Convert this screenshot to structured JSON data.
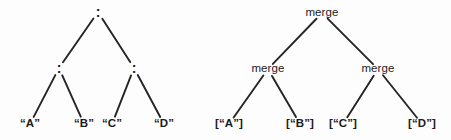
{
  "figure": {
    "background_color": "#fdfdfd",
    "ink_color": "#1b1b1b",
    "edge_color": "#242424",
    "width": 451,
    "height": 140
  },
  "diagram_data": {
    "type": "diagram",
    "subtype": "binary-expression-trees",
    "tree_count": 2,
    "trees": [
      {
        "id": "cons-tree",
        "name": "left-cons-tree",
        "root_operator": ":",
        "nodes": [
          {
            "id": "L0",
            "label": ":",
            "role": "operator",
            "depth": 0,
            "x": 98,
            "y": 12
          },
          {
            "id": "L1",
            "label": ":",
            "role": "operator",
            "depth": 1,
            "x": 59,
            "y": 68
          },
          {
            "id": "L2",
            "label": ":",
            "role": "operator",
            "depth": 1,
            "x": 134,
            "y": 68
          },
          {
            "id": "L3",
            "label": "“A”",
            "role": "leaf",
            "depth": 2,
            "x": 30,
            "y": 124
          },
          {
            "id": "L4",
            "label": "“B”",
            "role": "leaf",
            "depth": 2,
            "x": 84,
            "y": 124
          },
          {
            "id": "L5",
            "label": "“C”",
            "role": "leaf",
            "depth": 2,
            "x": 112,
            "y": 124
          },
          {
            "id": "L6",
            "label": "“D”",
            "role": "leaf",
            "depth": 2,
            "x": 164,
            "y": 124
          }
        ],
        "edges": [
          {
            "from": "L0",
            "to": "L1"
          },
          {
            "from": "L0",
            "to": "L2"
          },
          {
            "from": "L1",
            "to": "L3"
          },
          {
            "from": "L1",
            "to": "L4"
          },
          {
            "from": "L2",
            "to": "L5"
          },
          {
            "from": "L2",
            "to": "L6"
          }
        ]
      },
      {
        "id": "merge-tree",
        "name": "right-merge-tree",
        "root_operator": "merge",
        "nodes": [
          {
            "id": "R0",
            "label": "merge",
            "role": "function",
            "depth": 0,
            "x": 322,
            "y": 13
          },
          {
            "id": "R1",
            "label": "merge",
            "role": "function",
            "depth": 1,
            "x": 268,
            "y": 69
          },
          {
            "id": "R2",
            "label": "merge",
            "role": "function",
            "depth": 1,
            "x": 378,
            "y": 69
          },
          {
            "id": "R3",
            "label": "[“A”]",
            "role": "leaf",
            "depth": 2,
            "x": 229,
            "y": 124
          },
          {
            "id": "R4",
            "label": "[“B”]",
            "role": "leaf",
            "depth": 2,
            "x": 300,
            "y": 124
          },
          {
            "id": "R5",
            "label": "[“C”]",
            "role": "leaf",
            "depth": 2,
            "x": 343,
            "y": 124
          },
          {
            "id": "R6",
            "label": "[“D”]",
            "role": "leaf",
            "depth": 2,
            "x": 422,
            "y": 124
          }
        ],
        "edges": [
          {
            "from": "R0",
            "to": "R1"
          },
          {
            "from": "R0",
            "to": "R2"
          },
          {
            "from": "R1",
            "to": "R3"
          },
          {
            "from": "R1",
            "to": "R4"
          },
          {
            "from": "R2",
            "to": "R5"
          },
          {
            "from": "R2",
            "to": "R6"
          }
        ]
      }
    ]
  }
}
